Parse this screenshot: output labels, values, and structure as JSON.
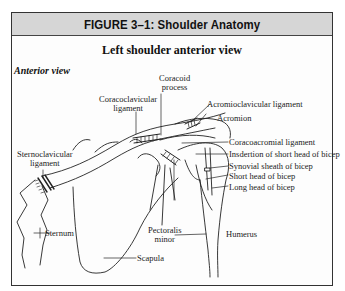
{
  "figure": {
    "title": "FIGURE 3–1:  Shoulder Anatomy",
    "subtitle": "Left shoulder anterior view",
    "view_label": "Anterior view"
  },
  "labels": {
    "coracoid_process_1": "Coracoid",
    "coracoid_process_2": "process",
    "coracoclavicular_1": "Coracoclavicular",
    "coracoclavicular_2": "ligament",
    "acromioclavicular": "Acromioclavicular ligament",
    "acromion": "Acromion",
    "sternoclavicular_1": "Sternoclavicular",
    "sternoclavicular_2": "ligament",
    "coracoacromial": "Coracoacromial ligament",
    "insertion_short_head": "Insdertion of short head of bicep",
    "synovial_sheath": "Synovial sheath of bicep",
    "short_head": "Short head of bicep",
    "long_head": "Long head of bicep",
    "sternum": "Sternum",
    "pectoralis_1": "Pectoralis",
    "pectoralis_2": "minor",
    "scapula": "Scapula",
    "humerus": "Humerus"
  },
  "colors": {
    "header_bg": "#d6d6d6",
    "line": "#222222",
    "paper": "#fdfdfd"
  }
}
